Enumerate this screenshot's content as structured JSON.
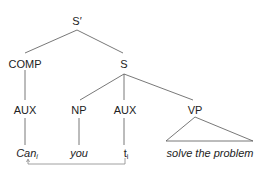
{
  "tree": {
    "root": {
      "label": "S′"
    },
    "comp": {
      "label": "COMP"
    },
    "s": {
      "label": "S"
    },
    "aux1": {
      "label": "AUX"
    },
    "np": {
      "label": "NP"
    },
    "aux2": {
      "label": "AUX"
    },
    "vp": {
      "label": "VP"
    },
    "leaves": {
      "can": {
        "word": "Can",
        "index": "i"
      },
      "you": {
        "word": "you"
      },
      "trace": {
        "word": "t",
        "index": "i"
      },
      "vp_phrase": {
        "word": "solve the problem"
      }
    }
  },
  "movement_arrow": {
    "from": "trace",
    "to": "can"
  },
  "colors": {
    "line": "#555555",
    "text": "#222222",
    "arrow": "#888888"
  }
}
